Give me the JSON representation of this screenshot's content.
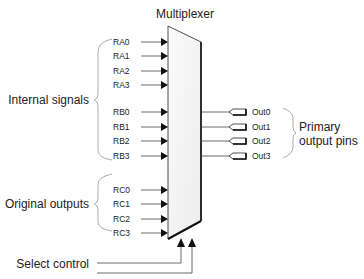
{
  "title": "Multiplexer",
  "groups": [
    {
      "label": "Internal signals",
      "inputs": [
        "RA0",
        "RA1",
        "RA2",
        "RA3",
        "RB0",
        "RB1",
        "RB2",
        "RB3"
      ]
    },
    {
      "label": "Original outputs",
      "inputs": [
        "RC0",
        "RC1",
        "RC2",
        "RC3"
      ]
    }
  ],
  "outputs": {
    "label_line1": "Primary",
    "label_line2": "output pins",
    "pins": [
      "Out0",
      "Out1",
      "Out2",
      "Out3"
    ]
  },
  "select": {
    "label": "Select control"
  },
  "colors": {
    "mux_fill": "#f3f3f3",
    "stroke": "#222222",
    "brace": "#888888"
  }
}
